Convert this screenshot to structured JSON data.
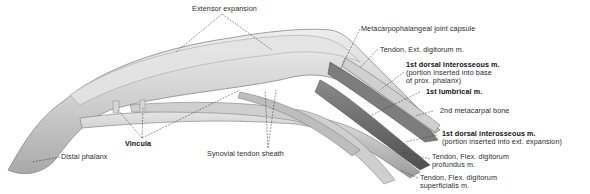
{
  "figure": {
    "type": "anatomical-illustration"
  },
  "labels": {
    "extensor_expansion": "Extensor expansion",
    "mcp_capsule": "Metacarpophalangeal joint capsule",
    "tendon_ext_digitorum": "Tendon, Ext. digitorum m.",
    "dorsal_interosseous_1": {
      "title": "1st dorsal interosseous m.",
      "line1": "(portion inserted into base",
      "line2": "of prox. phalanx)"
    },
    "lumbrical_1": "1st lumbrical m.",
    "metacarpal_2": "2nd metacarpal bone",
    "dorsal_interosseous_2": {
      "title": "1st dorsal interosseous m.",
      "line1": "(portion inserted into ext. expansion)"
    },
    "flex_profundus": {
      "line1": "Tendon, Flex. digitorum",
      "line2": "profundus m."
    },
    "flex_superficialis": {
      "line1": "Tendon, Flex. digitorum",
      "line2": "superficialis m."
    },
    "vincula": "Vincula",
    "synovial_sheath": "Synovial tendon sheath",
    "distal_phalanx": "Distal phalanx"
  },
  "colors": {
    "background": "#ffffff",
    "tissue_light": "#d9d9d9",
    "tissue_mid": "#b4b4b4",
    "tissue_dark": "#6e6e6e",
    "leader_line": "#333333"
  }
}
